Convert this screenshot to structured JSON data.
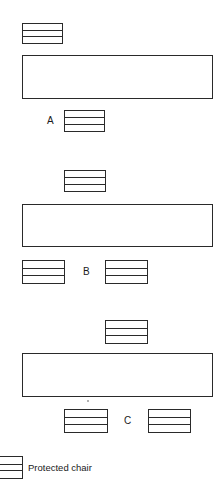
{
  "diagram": {
    "arrangements": [
      {
        "label": "A",
        "table": {
          "x": 22,
          "y": 55,
          "w": 191,
          "h": 44
        },
        "chairs": [
          {
            "x": 22,
            "y": 23,
            "w": 41,
            "h": 21
          },
          {
            "x": 64,
            "y": 110,
            "w": 41,
            "h": 22
          }
        ],
        "label_pos": {
          "x": 47,
          "y": 115
        }
      },
      {
        "label": "B",
        "table": {
          "x": 22,
          "y": 204,
          "w": 191,
          "h": 43
        },
        "chairs": [
          {
            "x": 64,
            "y": 170,
            "w": 42,
            "h": 22
          },
          {
            "x": 22,
            "y": 260,
            "w": 43,
            "h": 24
          },
          {
            "x": 105,
            "y": 260,
            "w": 43,
            "h": 24
          }
        ],
        "label_pos": {
          "x": 83,
          "y": 266
        }
      },
      {
        "label": "C",
        "table": {
          "x": 22,
          "y": 353,
          "w": 191,
          "h": 44
        },
        "chairs": [
          {
            "x": 105,
            "y": 320,
            "w": 43,
            "h": 24
          },
          {
            "x": 64,
            "y": 409,
            "w": 44,
            "h": 24
          },
          {
            "x": 148,
            "y": 409,
            "w": 43,
            "h": 24
          }
        ],
        "label_pos": {
          "x": 124,
          "y": 415
        }
      }
    ],
    "legend": {
      "symbol": "protected-chair",
      "label": "Protected chair",
      "chair": {
        "x": -4,
        "y": 456,
        "w": 27,
        "h": 23
      },
      "label_pos": {
        "x": 28,
        "y": 462
      }
    }
  }
}
